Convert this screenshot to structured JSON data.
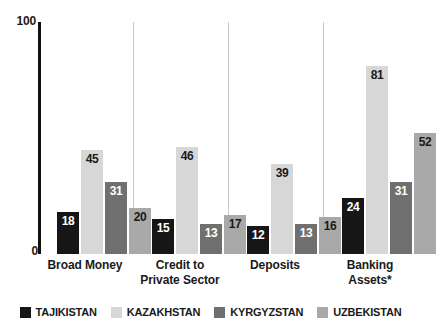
{
  "chart_data": {
    "type": "bar",
    "title": "",
    "subtitle": "",
    "xlabel": "",
    "ylabel": "",
    "ylim": [
      0,
      100
    ],
    "grid": false,
    "legend_position": "bottom",
    "categories": [
      "Broad Money",
      "Credit to Private Sector",
      "Deposits",
      "Banking Assets*"
    ],
    "series": [
      {
        "name": "TAJIKISTAN",
        "color": "#161616",
        "label_color": "#ffffff",
        "values": [
          18,
          15,
          12,
          24
        ]
      },
      {
        "name": "KAZAKHSTAN",
        "color": "#d7d7d7",
        "label_color": "#1a1a1a",
        "values": [
          45,
          46,
          39,
          81
        ]
      },
      {
        "name": "KYRGYZSTAN",
        "color": "#6f6f6f",
        "label_color": "#ffffff",
        "values": [
          31,
          13,
          13,
          31
        ]
      },
      {
        "name": "UZBEKISTAN",
        "color": "#a9a9a9",
        "label_color": "#1a1a1a",
        "values": [
          20,
          17,
          16,
          52
        ]
      }
    ],
    "y_ticks": [
      "100",
      "0"
    ]
  },
  "axis": {
    "y_max_label": "100",
    "y_min_label": "0"
  },
  "categories": [
    {
      "line1": "Broad Money",
      "line2": ""
    },
    {
      "line1": "Credit to",
      "line2": "Private Sector"
    },
    {
      "line1": "Deposits",
      "line2": ""
    },
    {
      "line1": "Banking",
      "line2": "Assets*"
    }
  ],
  "legend": {
    "items": [
      {
        "label": "TAJIKISTAN",
        "color": "#161616"
      },
      {
        "label": "KAZAKHSTAN",
        "color": "#d7d7d7"
      },
      {
        "label": "KYRGYZSTAN",
        "color": "#6f6f6f"
      },
      {
        "label": "UZBEKISTAN",
        "color": "#a9a9a9"
      }
    ]
  }
}
